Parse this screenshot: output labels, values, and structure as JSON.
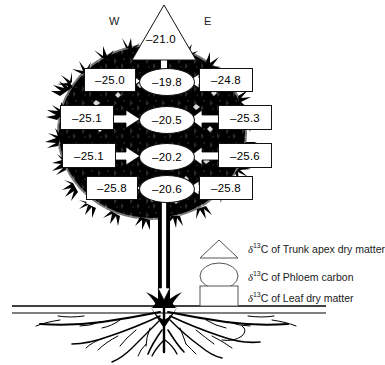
{
  "figure": {
    "orientation": {
      "west_label": "W",
      "east_label": "E"
    },
    "trunk_apex": {
      "symbol": "triangle",
      "value": "–21.0"
    },
    "phloem_nodes": [
      {
        "symbol": "ellipse",
        "value": "–19.8",
        "level": 1
      },
      {
        "symbol": "ellipse",
        "value": "–20.5",
        "level": 2
      },
      {
        "symbol": "ellipse",
        "value": "–20.2",
        "level": 3
      },
      {
        "symbol": "ellipse",
        "value": "–20.6",
        "level": 4
      }
    ],
    "leaf_west": [
      {
        "symbol": "rect",
        "value": "–25.0",
        "level": 1
      },
      {
        "symbol": "rect",
        "value": "–25.1",
        "level": 2
      },
      {
        "symbol": "rect",
        "value": "–25.1",
        "level": 3
      },
      {
        "symbol": "rect",
        "value": "–25.8",
        "level": 4
      }
    ],
    "leaf_east": [
      {
        "symbol": "rect",
        "value": "–24.8",
        "level": 1
      },
      {
        "symbol": "rect",
        "value": "–25.3",
        "level": 2
      },
      {
        "symbol": "rect",
        "value": "–25.6",
        "level": 3
      },
      {
        "symbol": "rect",
        "value": "–25.8",
        "level": 4
      }
    ],
    "legend": [
      {
        "symbol": "triangle",
        "text": "C of Trunk apex dry matter",
        "delta": "δ",
        "sup": "13"
      },
      {
        "symbol": "ellipse",
        "text": "C of Phloem carbon",
        "delta": "δ",
        "sup": "13"
      },
      {
        "symbol": "rect",
        "text": "C of Leaf dry matter",
        "delta": "δ",
        "sup": "13"
      }
    ],
    "colors": {
      "ink": "#000000",
      "background": "#ffffff",
      "text": "#1a1a1a"
    }
  }
}
